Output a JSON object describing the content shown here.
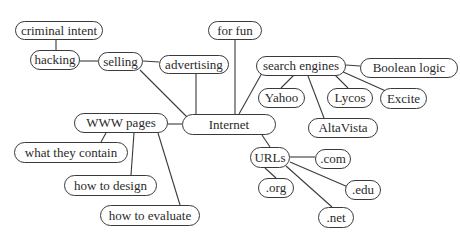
{
  "diagram": {
    "type": "mind-map",
    "colors": {
      "stroke": "#3a3a3a",
      "text": "#2a2a2a",
      "background": "#ffffff"
    },
    "root": "internet",
    "nodes": {
      "internet": {
        "label": "Internet"
      },
      "for_fun": {
        "label": "for fun"
      },
      "advertising": {
        "label": "advertising"
      },
      "selling": {
        "label": "selling"
      },
      "hacking": {
        "label": "hacking"
      },
      "criminal_intent": {
        "label": "criminal intent"
      },
      "search_engines": {
        "label": "search engines"
      },
      "boolean_logic": {
        "label": "Boolean logic"
      },
      "yahoo": {
        "label": "Yahoo"
      },
      "lycos": {
        "label": "Lycos"
      },
      "excite": {
        "label": "Excite"
      },
      "altavista": {
        "label": "AltaVista"
      },
      "www_pages": {
        "label": "WWW pages"
      },
      "what_they_contain": {
        "label": "what they contain"
      },
      "how_to_design": {
        "label": "how to design"
      },
      "how_to_evaluate": {
        "label": "how to evaluate"
      },
      "urls": {
        "label": "URLs"
      },
      "dot_com": {
        "label": ".com"
      },
      "dot_org": {
        "label": ".org"
      },
      "dot_edu": {
        "label": ".edu"
      },
      "dot_net": {
        "label": ".net"
      }
    },
    "edges": [
      [
        "internet",
        "for_fun"
      ],
      [
        "internet",
        "advertising"
      ],
      [
        "internet",
        "selling"
      ],
      [
        "internet",
        "search_engines"
      ],
      [
        "internet",
        "www_pages"
      ],
      [
        "internet",
        "urls"
      ],
      [
        "selling",
        "advertising"
      ],
      [
        "selling",
        "hacking"
      ],
      [
        "hacking",
        "criminal_intent"
      ],
      [
        "search_engines",
        "boolean_logic"
      ],
      [
        "search_engines",
        "yahoo"
      ],
      [
        "search_engines",
        "lycos"
      ],
      [
        "search_engines",
        "excite"
      ],
      [
        "search_engines",
        "altavista"
      ],
      [
        "www_pages",
        "what_they_contain"
      ],
      [
        "www_pages",
        "how_to_design"
      ],
      [
        "www_pages",
        "how_to_evaluate"
      ],
      [
        "urls",
        "dot_com"
      ],
      [
        "urls",
        "dot_org"
      ],
      [
        "urls",
        "dot_edu"
      ],
      [
        "urls",
        "dot_net"
      ]
    ]
  }
}
